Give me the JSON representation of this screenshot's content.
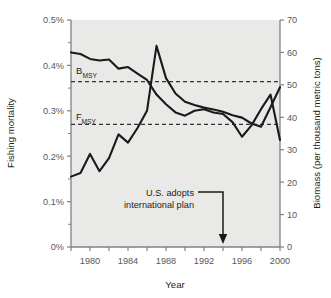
{
  "chart_data": {
    "type": "line",
    "title": "",
    "xlabel": "Year",
    "ylabel": "Fishing mortality",
    "y2label": "Biomass (per thousand metric tons)",
    "grid": false,
    "legend_position": "none",
    "xlim": [
      1978,
      2000
    ],
    "ylim": [
      0,
      0.5
    ],
    "y2lim": [
      0,
      70
    ],
    "x_ticks_labeled": [
      "1980",
      "1984",
      "1988",
      "1992",
      "1996",
      "2000"
    ],
    "x_ticks_all": [
      1978,
      1980,
      1982,
      1984,
      1986,
      1988,
      1990,
      1992,
      1994,
      1996,
      1998,
      2000
    ],
    "y_ticks": [
      "0%",
      "0.1%",
      "0.2%",
      "0.3%",
      "0.4%",
      "0.5%"
    ],
    "y_tick_values": [
      0,
      0.1,
      0.2,
      0.3,
      0.4,
      0.5
    ],
    "y2_ticks": [
      "0",
      "10",
      "20",
      "30",
      "40",
      "50",
      "60",
      "70"
    ],
    "y2_tick_values": [
      0,
      10,
      20,
      30,
      40,
      50,
      60,
      70
    ],
    "x": [
      1978,
      1979,
      1980,
      1981,
      1982,
      1983,
      1984,
      1985,
      1986,
      1987,
      1988,
      1989,
      1990,
      1991,
      1992,
      1993,
      1994,
      1995,
      1996,
      1997,
      1998,
      1999,
      2000
    ],
    "series": [
      {
        "name": "Fishing mortality",
        "axis": "left",
        "unit": "%",
        "values": [
          0.155,
          0.163,
          0.205,
          0.167,
          0.196,
          0.248,
          0.23,
          0.262,
          0.3,
          0.443,
          0.372,
          0.338,
          0.32,
          0.313,
          0.307,
          0.303,
          0.298,
          0.29,
          0.285,
          0.272,
          0.265,
          0.308,
          0.352
        ]
      },
      {
        "name": "Biomass",
        "axis": "right",
        "unit": "thousand metric tons",
        "values": [
          60.0,
          59.5,
          58.0,
          57.5,
          57.8,
          55.0,
          55.5,
          53.5,
          51.5,
          47.0,
          44.0,
          41.5,
          40.5,
          42.0,
          42.5,
          41.5,
          41.0,
          38.5,
          34.0,
          37.5,
          42.5,
          47.0,
          33.0
        ]
      }
    ],
    "reference_lines": [
      {
        "label": "B",
        "sublabel": "MSY",
        "axis": "right",
        "value": 51,
        "left_equiv": 0.365,
        "style": "dashed"
      },
      {
        "label": "F",
        "sublabel": "MSY",
        "axis": "left",
        "value": 0.27,
        "right_equiv": 38,
        "style": "dashed"
      }
    ],
    "annotations": [
      {
        "line1": "U.S. adopts",
        "line2": "international plan",
        "points_to_year": 1994,
        "arrow": "down"
      }
    ],
    "colors": {
      "line": "#1a1a1a",
      "plot_background": "#e9e9e7",
      "axis": "#808082",
      "tick_text": "#58595b",
      "reference_line": "#333333"
    }
  }
}
